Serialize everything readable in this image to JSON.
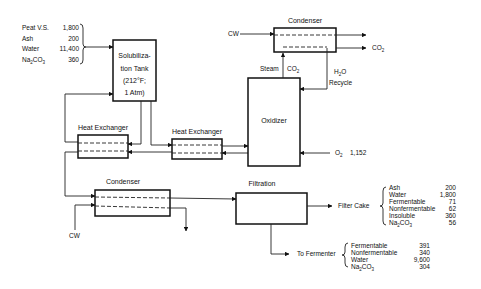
{
  "feed": {
    "items": [
      {
        "label": "Peat V.S.",
        "value": "1,800"
      },
      {
        "label": "Ash",
        "value": "200"
      },
      {
        "label": "Water",
        "value": "11,400"
      },
      {
        "label": "Na2CO3",
        "value": "360"
      }
    ]
  },
  "units": {
    "solubilization_tank": {
      "line1": "Solubiliza-",
      "line2": "tion Tank",
      "line3": "(212°F;",
      "line4": "1 Atm)"
    },
    "condenser_top": "Condenser",
    "oxidizer": "Oxidizer",
    "heat_exchanger_1": "Heat Exchanger",
    "heat_exchanger_2": "Heat Exchanger",
    "condenser_bottom": "Condenser",
    "filtration": "Filtration"
  },
  "streams": {
    "cw_top": "CW",
    "co2_out": "CO2",
    "steam": "Steam",
    "co2_in": "CO2",
    "h2o": "H2O",
    "recycle": "Recycle",
    "o2": "O2",
    "o2_value": "1,152",
    "cw_bottom": "CW",
    "filter_cake": "Filter Cake",
    "to_fermenter": "To Fermenter"
  },
  "filter_cake": {
    "items": [
      {
        "label": "Ash",
        "value": "200"
      },
      {
        "label": "Water",
        "value": "1,800"
      },
      {
        "label": "Fermentable",
        "value": "71"
      },
      {
        "label": "Nonfermentable",
        "value": "62"
      },
      {
        "label": "Insoluble",
        "value": "360"
      },
      {
        "label": "Na2CO3",
        "value": "56"
      }
    ]
  },
  "fermenter": {
    "items": [
      {
        "label": "Fermentable",
        "value": "391"
      },
      {
        "label": "Nonfermentable",
        "value": "340"
      },
      {
        "label": "Water",
        "value": "9,600"
      },
      {
        "label": "Na2CO3",
        "value": "304"
      }
    ]
  }
}
